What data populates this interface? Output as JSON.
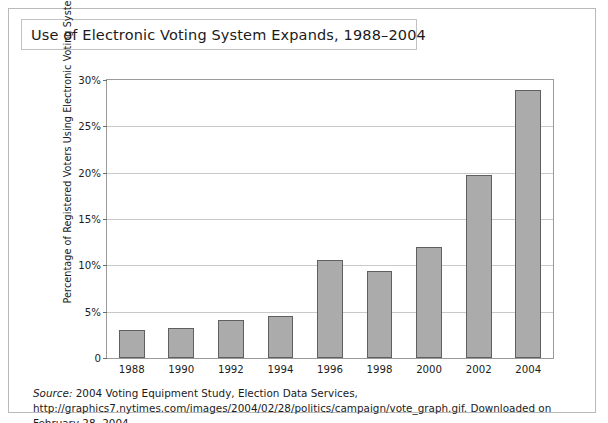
{
  "figure": {
    "title": "Use of Electronic Voting System Expands, 1988–2004",
    "source_label": "Source:",
    "source_text": " 2004 Voting Equipment Study, Election Data Services, http://graphics7.nytimes.com/images/2004/02/28/politics/campaign/vote_graph.gif. Downloaded on February 28, 2004."
  },
  "colors": {
    "bar_fill": "#ababab",
    "bar_outline": "#5f5f5f",
    "gridline": "#c9c9c9",
    "plot_border": "#9a9a9a",
    "frame_border": "#b9b9b9",
    "text": "#1b1b1b"
  },
  "chart_data": {
    "type": "bar",
    "title": "Use of Electronic Voting System Expands, 1988–2004",
    "xlabel": "",
    "ylabel": "Percentage of Registered Voters Using Electronic Voting Systems",
    "categories": [
      "1988",
      "1990",
      "1992",
      "1994",
      "1996",
      "1998",
      "2000",
      "2002",
      "2004"
    ],
    "values": [
      3.0,
      3.2,
      4.1,
      4.5,
      10.6,
      9.4,
      12.0,
      19.8,
      28.9
    ],
    "ylim": [
      0,
      30
    ],
    "ytick_values": [
      0,
      5,
      10,
      15,
      20,
      25,
      30
    ],
    "ytick_labels": [
      "0",
      "5%",
      "10%",
      "15%",
      "20%",
      "25%",
      "30%"
    ],
    "grid": true,
    "grid_axis": "y",
    "legend": false,
    "legend_position": "none"
  }
}
